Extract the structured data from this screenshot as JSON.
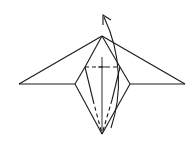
{
  "diagram": {
    "type": "origami-fold-step",
    "background": "#ffffff",
    "line_color": "#1a1a1a",
    "canvas": {
      "width": 195,
      "height": 146
    },
    "points": {
      "apex": [
        102,
        36
      ],
      "left_wing_tip": [
        19,
        84
      ],
      "right_wing_tip": [
        185,
        84
      ],
      "left_diamond": [
        75,
        84
      ],
      "right_diamond": [
        130,
        84
      ],
      "left_upper": [
        85,
        67
      ],
      "right_upper": [
        120,
        67
      ],
      "bottom": [
        102,
        134
      ]
    },
    "solid_lines": [
      {
        "name": "left-wing-top-edge",
        "from": [
          19,
          84
        ],
        "to": [
          102,
          36
        ]
      },
      {
        "name": "right-wing-top-edge",
        "from": [
          102,
          36
        ],
        "to": [
          185,
          84
        ]
      },
      {
        "name": "left-wing-bottom-edge",
        "from": [
          19,
          84
        ],
        "to": [
          75,
          84
        ]
      },
      {
        "name": "right-wing-bottom-edge",
        "from": [
          130,
          84
        ],
        "to": [
          185,
          84
        ]
      },
      {
        "name": "left-kite-upper-edge",
        "from": [
          102,
          36
        ],
        "to": [
          85,
          67
        ]
      },
      {
        "name": "right-kite-upper-edge",
        "from": [
          102,
          36
        ],
        "to": [
          120,
          67
        ]
      },
      {
        "name": "left-diamond-upper",
        "from": [
          85,
          67
        ],
        "to": [
          75,
          84
        ]
      },
      {
        "name": "right-diamond-upper",
        "from": [
          120,
          67
        ],
        "to": [
          130,
          84
        ]
      },
      {
        "name": "left-diamond-lower",
        "from": [
          75,
          84
        ],
        "to": [
          102,
          134
        ]
      },
      {
        "name": "right-diamond-lower",
        "from": [
          130,
          84
        ],
        "to": [
          102,
          134
        ]
      },
      {
        "name": "left-inner-solid",
        "from": [
          85,
          67
        ],
        "to": [
          93,
          100
        ]
      },
      {
        "name": "right-inner-solid",
        "from": [
          120,
          67
        ],
        "to": [
          112,
          100
        ]
      }
    ],
    "dashed_lines": [
      {
        "name": "valley-fold-horizontal",
        "from": [
          85,
          67
        ],
        "to": [
          120,
          67
        ]
      },
      {
        "name": "valley-fold-left-diagonal",
        "from": [
          93,
          100
        ],
        "to": [
          102,
          134
        ]
      },
      {
        "name": "valley-fold-right-diagonal",
        "from": [
          112,
          100
        ],
        "to": [
          102,
          134
        ]
      }
    ],
    "center_line": {
      "name": "center-crease",
      "from": [
        102,
        57
      ],
      "to": [
        102,
        134
      ]
    },
    "center_tick": {
      "name": "center-cross-tick",
      "from": [
        98,
        67
      ],
      "to": [
        106,
        67
      ]
    },
    "arrow": {
      "name": "fold-up-arrow",
      "path": "M 111 128 C 122 95, 122 55, 104 17",
      "head_tip": [
        103,
        15
      ],
      "head_left": [
        103,
        25
      ],
      "head_right": [
        111,
        20
      ]
    }
  }
}
